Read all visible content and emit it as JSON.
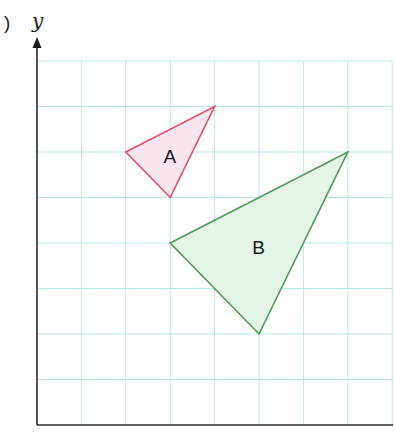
{
  "figure": {
    "part_marker": ")",
    "y_axis_label": "y"
  },
  "grid": {
    "origin_px": [
      37,
      425
    ],
    "cell_w": 44.4,
    "cell_h": 45.5,
    "cols": 8,
    "rows": 8,
    "color": "#b8e6ee",
    "axis_color": "#2a2a2a"
  },
  "shapes": [
    {
      "label": "A",
      "vertices": [
        [
          2,
          6
        ],
        [
          4,
          7
        ],
        [
          3,
          5
        ]
      ],
      "stroke": "#e0506a",
      "fill": "#f8e6ee",
      "label_pos": [
        2.85,
        5.75
      ]
    },
    {
      "label": "B",
      "vertices": [
        [
          3,
          4
        ],
        [
          7,
          6
        ],
        [
          5,
          2
        ]
      ],
      "stroke": "#4f9a5a",
      "fill": "#e4f4e6",
      "label_pos": [
        4.85,
        3.75
      ]
    }
  ]
}
